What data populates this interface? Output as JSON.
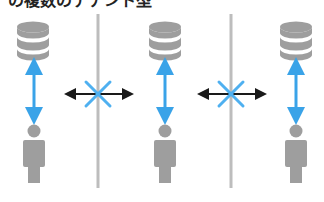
{
  "caption": {
    "text": "の複数のテナント型"
  },
  "colors": {
    "icon_gray": "#9e9e9e",
    "divider_gray": "#bdbdbd",
    "link_blue": "#3aa3e8",
    "blocked_arrow": "#1a1a1a",
    "blocked_x": "#4fb0f0"
  },
  "tenants": [
    {
      "id": "tenant-1",
      "db_label": "database",
      "user_label": "user",
      "connection": "allowed"
    },
    {
      "id": "tenant-2",
      "db_label": "database",
      "user_label": "user",
      "connection": "allowed"
    },
    {
      "id": "tenant-3",
      "db_label": "database",
      "user_label": "user",
      "connection": "allowed"
    }
  ],
  "isolation_barriers": [
    {
      "between": [
        "tenant-1",
        "tenant-2"
      ],
      "status": "blocked"
    },
    {
      "between": [
        "tenant-2",
        "tenant-3"
      ],
      "status": "blocked"
    }
  ]
}
